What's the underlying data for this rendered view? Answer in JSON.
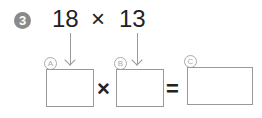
{
  "problem": {
    "number": "3",
    "operand1": "18",
    "operator": "×",
    "operand2": "13"
  },
  "blanks": {
    "a_label": "A",
    "b_label": "B",
    "c_label": "C",
    "a_value": "",
    "b_value": "",
    "c_value": ""
  },
  "equation": {
    "times": "×",
    "equals": "="
  }
}
